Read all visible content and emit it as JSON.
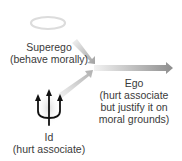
{
  "superego": {
    "title": "Superego",
    "subtitle": "(behave morally)",
    "icon": "halo-icon"
  },
  "id": {
    "title": "Id",
    "subtitle": "(hurt associate)",
    "icon": "trident-icon"
  },
  "ego": {
    "title": "Ego",
    "line1": "(hurt associate",
    "line2": "but justify it on",
    "line3": "moral grounds)"
  },
  "colors": {
    "arrow": "#9a9a9a",
    "text": "#3a3a3a",
    "halo": "#d8d8d8",
    "trident": "#111111"
  }
}
